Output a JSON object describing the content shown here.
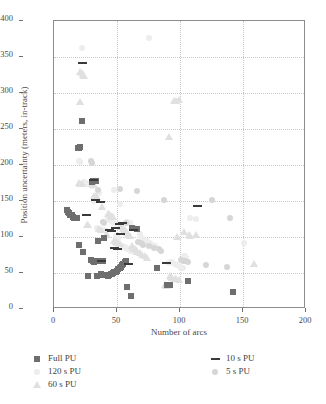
{
  "chart_data": {
    "type": "scatter",
    "title": "",
    "xlabel": "Number of arcs",
    "ylabel": "Position uncertainty (meters, in-track)",
    "xlim": [
      0,
      200
    ],
    "ylim": [
      0,
      400
    ],
    "xticks": [
      0,
      50,
      100,
      150,
      200
    ],
    "yticks": [
      0,
      50,
      100,
      150,
      200,
      250,
      300,
      350,
      400
    ],
    "grid": true,
    "legend_position": "below-axes",
    "series": [
      {
        "name": "Full PU",
        "marker": "square",
        "color": "#6e6e6e",
        "points": [
          [
            10,
            137
          ],
          [
            11,
            135
          ],
          [
            12,
            133
          ],
          [
            13,
            131
          ],
          [
            14,
            130
          ],
          [
            15,
            128
          ],
          [
            16,
            127
          ],
          [
            18,
            126
          ],
          [
            20,
            89
          ],
          [
            23,
            79
          ],
          [
            27,
            46
          ],
          [
            29,
            68
          ],
          [
            30,
            177
          ],
          [
            31,
            178
          ],
          [
            31,
            66
          ],
          [
            32,
            65
          ],
          [
            33,
            178
          ],
          [
            34,
            46
          ],
          [
            35,
            95
          ],
          [
            36,
            66
          ],
          [
            37,
            48
          ],
          [
            38,
            47
          ],
          [
            39,
            66
          ],
          [
            40,
            99
          ],
          [
            41,
            47
          ],
          [
            42,
            47
          ],
          [
            43,
            46
          ],
          [
            44,
            47
          ],
          [
            45,
            48
          ],
          [
            46,
            49
          ],
          [
            47,
            50
          ],
          [
            48,
            51
          ],
          [
            49,
            52
          ],
          [
            50,
            53
          ],
          [
            51,
            55
          ],
          [
            52,
            57
          ],
          [
            53,
            59
          ],
          [
            54,
            61
          ],
          [
            55,
            63
          ],
          [
            56,
            65
          ],
          [
            57,
            67
          ],
          [
            58,
            31
          ],
          [
            61,
            18
          ],
          [
            22,
            261
          ],
          [
            19,
            224
          ],
          [
            20,
            223
          ],
          [
            21,
            225
          ],
          [
            82,
            57
          ],
          [
            90,
            33
          ],
          [
            91,
            34
          ],
          [
            92,
            33
          ],
          [
            106,
            39
          ],
          [
            142,
            23
          ],
          [
            62,
            112
          ],
          [
            66,
            111
          ]
        ]
      },
      {
        "name": "120 s PU",
        "marker": "circle",
        "color": "#ededed",
        "points": [
          [
            22,
            362
          ],
          [
            75,
            376
          ],
          [
            20,
            206
          ],
          [
            21,
            204
          ],
          [
            36,
            161
          ],
          [
            48,
            165
          ],
          [
            52,
            146
          ],
          [
            43,
            126
          ],
          [
            44,
            124
          ],
          [
            45,
            123
          ],
          [
            46,
            122
          ],
          [
            47,
            121
          ],
          [
            48,
            120
          ],
          [
            50,
            118
          ],
          [
            52,
            117
          ],
          [
            58,
            121
          ],
          [
            60,
            119
          ],
          [
            40,
            110
          ],
          [
            41,
            108
          ],
          [
            34,
            113
          ],
          [
            35,
            111
          ],
          [
            33,
            152
          ],
          [
            32,
            150
          ],
          [
            63,
            113
          ],
          [
            64,
            112
          ],
          [
            68,
            104
          ],
          [
            70,
            98
          ],
          [
            72,
            96
          ],
          [
            74,
            94
          ],
          [
            76,
            92
          ],
          [
            78,
            89
          ],
          [
            80,
            87
          ],
          [
            94,
            65
          ],
          [
            96,
            63
          ],
          [
            98,
            61
          ],
          [
            100,
            59
          ],
          [
            102,
            57
          ],
          [
            103,
            74
          ],
          [
            104,
            73
          ],
          [
            105,
            71
          ],
          [
            108,
            126
          ],
          [
            113,
            125
          ],
          [
            151,
            91
          ],
          [
            93,
            65
          ],
          [
            91,
            64
          ],
          [
            55,
            88
          ],
          [
            56,
            86
          ],
          [
            57,
            85
          ],
          [
            58,
            84
          ],
          [
            59,
            83
          ],
          [
            60,
            82
          ],
          [
            61,
            81
          ],
          [
            62,
            80
          ],
          [
            49,
            101
          ],
          [
            50,
            100
          ],
          [
            51,
            99
          ],
          [
            28,
            173
          ],
          [
            29,
            172
          ],
          [
            30,
            171
          ],
          [
            24,
            176
          ],
          [
            25,
            175
          ],
          [
            26,
            174
          ]
        ]
      },
      {
        "name": "60 s PU",
        "marker": "triangle",
        "color": "#e0e0e0",
        "points": [
          [
            21,
            330
          ],
          [
            22,
            328
          ],
          [
            23,
            326
          ],
          [
            24,
            325
          ],
          [
            21,
            288
          ],
          [
            95,
            290
          ],
          [
            97,
            289
          ],
          [
            99,
            291
          ],
          [
            91,
            240
          ],
          [
            30,
            175
          ],
          [
            31,
            174
          ],
          [
            32,
            173
          ],
          [
            20,
            176
          ],
          [
            21,
            175
          ],
          [
            22,
            174
          ],
          [
            33,
            157
          ],
          [
            34,
            156
          ],
          [
            32,
            158
          ],
          [
            38,
            143
          ],
          [
            26,
            118
          ],
          [
            27,
            117
          ],
          [
            43,
            133
          ],
          [
            44,
            132
          ],
          [
            45,
            130
          ],
          [
            46,
            129
          ],
          [
            47,
            128
          ],
          [
            53,
            115
          ],
          [
            54,
            114
          ],
          [
            55,
            112
          ],
          [
            56,
            111
          ],
          [
            58,
            106
          ],
          [
            59,
            104
          ],
          [
            60,
            102
          ],
          [
            48,
            95
          ],
          [
            49,
            94
          ],
          [
            50,
            93
          ],
          [
            51,
            92
          ],
          [
            52,
            91
          ],
          [
            62,
            88
          ],
          [
            63,
            86
          ],
          [
            64,
            84
          ],
          [
            65,
            82
          ],
          [
            66,
            80
          ],
          [
            68,
            78
          ],
          [
            70,
            76
          ],
          [
            72,
            74
          ],
          [
            74,
            72
          ],
          [
            103,
            108
          ],
          [
            107,
            104
          ],
          [
            108,
            102
          ],
          [
            98,
            101
          ],
          [
            113,
            103
          ],
          [
            159,
            63
          ],
          [
            92,
            47
          ],
          [
            93,
            45
          ],
          [
            94,
            44
          ],
          [
            96,
            43
          ],
          [
            97,
            42
          ],
          [
            99,
            41
          ],
          [
            88,
            34
          ],
          [
            89,
            33
          ],
          [
            90,
            32
          ],
          [
            41,
            104
          ],
          [
            42,
            103
          ],
          [
            36,
            112
          ],
          [
            37,
            110
          ]
        ]
      },
      {
        "name": "10 s PU",
        "marker": "dash",
        "color": "#3a3a3a",
        "points": [
          [
            23,
            341
          ],
          [
            31,
            179
          ],
          [
            33,
            152
          ],
          [
            114,
            143
          ],
          [
            37,
            149
          ],
          [
            44,
            110
          ],
          [
            46,
            109
          ],
          [
            49,
            112
          ],
          [
            63,
            110
          ],
          [
            38,
            67
          ],
          [
            48,
            85
          ],
          [
            50,
            84
          ],
          [
            59,
            62
          ],
          [
            89,
            64
          ],
          [
            52,
            118
          ],
          [
            54,
            119
          ],
          [
            26,
            130
          ],
          [
            53,
            104
          ]
        ]
      },
      {
        "name": "5 s PU",
        "marker": "circle-lt",
        "color": "#d6d6d6",
        "points": [
          [
            35,
            165
          ],
          [
            52,
            166
          ],
          [
            66,
            164
          ],
          [
            87,
            151
          ],
          [
            125,
            151
          ],
          [
            140,
            126
          ],
          [
            39,
            121
          ],
          [
            40,
            120
          ],
          [
            57,
            120
          ],
          [
            67,
            93
          ],
          [
            69,
            91
          ],
          [
            71,
            89
          ],
          [
            75,
            87
          ],
          [
            79,
            85
          ],
          [
            83,
            83
          ],
          [
            85,
            81
          ],
          [
            101,
            68
          ],
          [
            102,
            67
          ],
          [
            104,
            66
          ],
          [
            106,
            65
          ],
          [
            121,
            61
          ],
          [
            137,
            58
          ],
          [
            29,
            205
          ],
          [
            30,
            203
          ]
        ]
      }
    ]
  },
  "axis": {
    "ytick_labels": [
      "0",
      "50",
      "100",
      "150",
      "200",
      "250",
      "300",
      "350",
      "400"
    ],
    "xtick_labels": [
      "0",
      "50",
      "100",
      "150",
      "200"
    ]
  },
  "legend": {
    "left_column": [
      {
        "label": "Full PU",
        "marker": "square",
        "color": "#6e6e6e"
      },
      {
        "label": "120 s PU",
        "marker": "circle",
        "color": "#ededed"
      },
      {
        "label": "60 s PU",
        "marker": "triangle",
        "color": "#e0e0e0"
      }
    ],
    "right_column": [
      {
        "label": "10 s PU",
        "marker": "dash",
        "color": "#3a3a3a"
      },
      {
        "label": "5 s PU",
        "marker": "circle-lt",
        "color": "#d6d6d6"
      }
    ]
  }
}
